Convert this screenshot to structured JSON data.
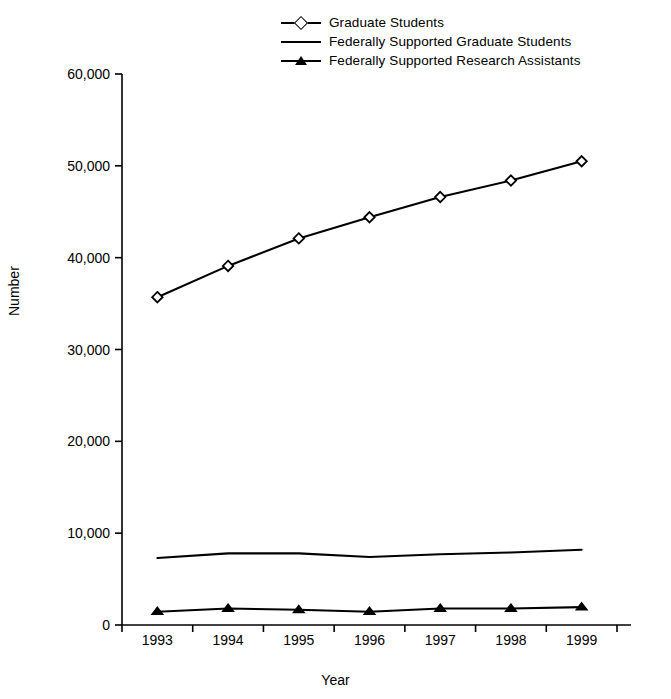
{
  "chart_data": {
    "type": "line",
    "title": "",
    "xlabel": "Year",
    "ylabel": "Number",
    "x": [
      1993,
      1994,
      1995,
      1996,
      1997,
      1998,
      1999
    ],
    "xtick_labels": [
      "1993",
      "1994",
      "1995",
      "1996",
      "1997",
      "1998",
      "1999"
    ],
    "ytick_labels": [
      "0",
      "10,000",
      "20,000",
      "30,000",
      "40,000",
      "50,000",
      "60,000"
    ],
    "ytick_values": [
      0,
      10000,
      20000,
      30000,
      40000,
      50000,
      60000
    ],
    "ylim": [
      0,
      60000
    ],
    "xlim": [
      1992.5,
      1999.5
    ],
    "grid": false,
    "legend_position": "top-center",
    "series": [
      {
        "name": "Graduate Students",
        "marker": "open-diamond",
        "color": "#000000",
        "values": [
          35700,
          39100,
          42100,
          44400,
          46600,
          48400,
          50500
        ]
      },
      {
        "name": "Federally Supported Graduate Students",
        "marker": "none",
        "color": "#000000",
        "values": [
          7300,
          7800,
          7800,
          7400,
          7700,
          7900,
          8200
        ]
      },
      {
        "name": "Federally Supported Research Assistants",
        "marker": "filled-triangle",
        "color": "#000000",
        "values": [
          1450,
          1800,
          1650,
          1450,
          1800,
          1800,
          1950
        ]
      }
    ]
  },
  "legend": {
    "entries": [
      {
        "label": "Graduate Students",
        "key": "line-with-open-diamond"
      },
      {
        "label": "Federally Supported Graduate Students",
        "key": "plain-line"
      },
      {
        "label": "Federally Supported Research Assistants",
        "key": "line-with-filled-triangle"
      }
    ]
  },
  "axes": {
    "y_title": "Number",
    "x_title": "Year"
  }
}
